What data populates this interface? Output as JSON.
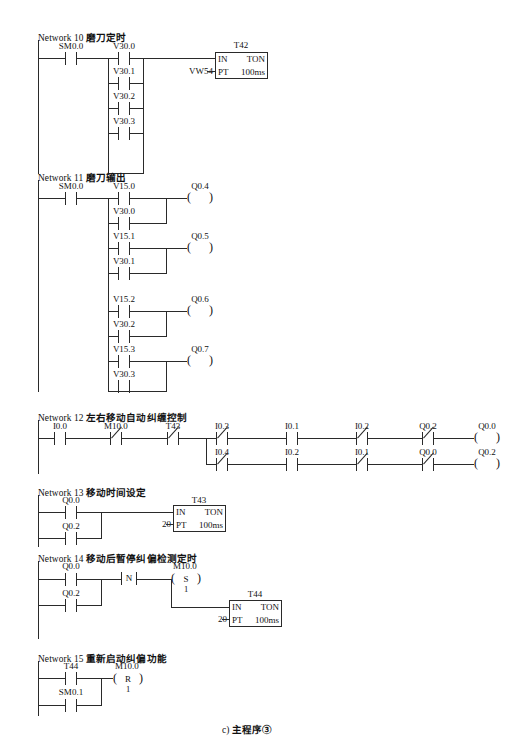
{
  "figure": {
    "caption": "c) 主程序③",
    "caption_prefix": "c)",
    "caption_text": "主程序③"
  },
  "networks": [
    {
      "id": "network-10",
      "number": "Network 10",
      "title": "磨刀定时",
      "contacts": [
        {
          "name": "SM0.0",
          "type": "NO"
        },
        {
          "name": "V30.0",
          "type": "NO"
        },
        {
          "name": "V30.1",
          "type": "NO"
        },
        {
          "name": "V30.2",
          "type": "NO"
        },
        {
          "name": "V30.3",
          "type": "NO"
        }
      ],
      "timer": {
        "name": "T42",
        "in": "IN",
        "mode": "TON",
        "pt": "PT",
        "base": "100ms",
        "preset": "VW54"
      }
    },
    {
      "id": "network-11",
      "number": "Network 11",
      "title": "磨刀输出",
      "enable_contact": {
        "name": "SM0.0",
        "type": "NO"
      },
      "rungs": [
        {
          "top": "V15.0",
          "bottom": "V30.0",
          "coil": "Q0.4"
        },
        {
          "top": "V15.1",
          "bottom": "V30.1",
          "coil": "Q0.5"
        },
        {
          "top": "V15.2",
          "bottom": "V30.2",
          "coil": "Q0.6"
        },
        {
          "top": "V15.3",
          "bottom": "V30.3",
          "coil": "Q0.7"
        }
      ]
    },
    {
      "id": "network-12",
      "number": "Network 12",
      "title": "左右移动自动纠缠控制",
      "series": [
        {
          "name": "I0.0",
          "type": "NO"
        },
        {
          "name": "M10.0",
          "type": "NC"
        },
        {
          "name": "T43",
          "type": "NC"
        }
      ],
      "branches": [
        {
          "contacts": [
            {
              "name": "I0.3",
              "type": "NC"
            },
            {
              "name": "I0.1",
              "type": "NO"
            },
            {
              "name": "I0.2",
              "type": "NC"
            },
            {
              "name": "Q0.2",
              "type": "NC"
            }
          ],
          "coil": "Q0.0"
        },
        {
          "contacts": [
            {
              "name": "I0.4",
              "type": "NC"
            },
            {
              "name": "I0.2",
              "type": "NO"
            },
            {
              "name": "I0.1",
              "type": "NC"
            },
            {
              "name": "Q0.0",
              "type": "NC"
            }
          ],
          "coil": "Q0.2"
        }
      ]
    },
    {
      "id": "network-13",
      "number": "Network 13",
      "title": "移动时间设定",
      "contacts": [
        {
          "name": "Q0.0",
          "type": "NO"
        },
        {
          "name": "Q0.2",
          "type": "NO"
        }
      ],
      "timer": {
        "name": "T43",
        "in": "IN",
        "mode": "TON",
        "pt": "PT",
        "base": "100ms",
        "preset": "20"
      }
    },
    {
      "id": "network-14",
      "number": "Network 14",
      "title": "移动后暂停纠偏检测定时",
      "contacts": [
        {
          "name": "Q0.0",
          "type": "NO"
        },
        {
          "name": "Q0.2",
          "type": "NO"
        }
      ],
      "transition": {
        "label": "N"
      },
      "coil": {
        "name": "M10.0",
        "op": "S",
        "count": "1"
      },
      "timer": {
        "name": "T44",
        "in": "IN",
        "mode": "TON",
        "pt": "PT",
        "base": "100ms",
        "preset": "20"
      }
    },
    {
      "id": "network-15",
      "number": "Network 15",
      "title": "重新启动纠偏功能",
      "contacts": [
        {
          "name": "T44",
          "type": "NO"
        },
        {
          "name": "SM0.1",
          "type": "NO"
        }
      ],
      "coil": {
        "name": "M10.0",
        "op": "R",
        "count": "1"
      }
    }
  ]
}
